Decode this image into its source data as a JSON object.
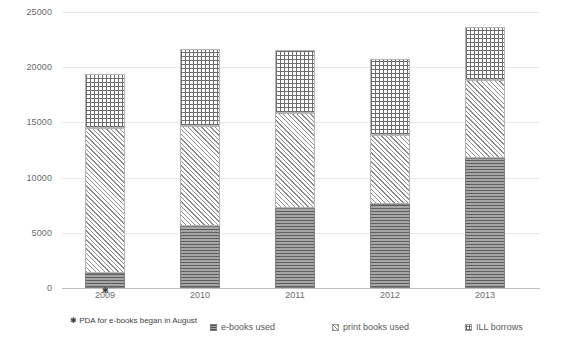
{
  "chart_data": {
    "type": "bar",
    "stacked": true,
    "title": "",
    "xlabel": "",
    "ylabel": "",
    "ylim": [
      0,
      25000
    ],
    "ytick_step": 5000,
    "ytick_labels": [
      "0",
      "5000",
      "10000",
      "15000",
      "20000",
      "25000"
    ],
    "ytick_values": [
      0,
      5000,
      10000,
      15000,
      20000,
      25000
    ],
    "grid": true,
    "legend_position": "bottom",
    "categories": [
      "2009",
      "2010",
      "2011",
      "2012",
      "2013"
    ],
    "series": [
      {
        "name": "e-books used",
        "values": [
          1350,
          5600,
          7300,
          7600,
          11800
        ]
      },
      {
        "name": "print books used",
        "values": [
          13200,
          9100,
          8600,
          6300,
          7100
        ]
      },
      {
        "name": "ILL borrows",
        "values": [
          4900,
          7000,
          5700,
          6900,
          4800
        ]
      }
    ],
    "totals": [
      19450,
      21700,
      21600,
      20800,
      23700
    ],
    "annotations": [
      {
        "text": "✱ PDA for e-books began in August",
        "attached_to": "2009"
      }
    ],
    "marker_symbol": "✱"
  },
  "axis": {
    "y_ticks": [
      "25000",
      "20000",
      "15000",
      "10000",
      "5000",
      "0"
    ],
    "x_ticks": [
      "2009",
      "2010",
      "2011",
      "2012",
      "2013"
    ]
  },
  "footnote": {
    "text": "✱ PDA for e-books began in August"
  },
  "legend": {
    "items": [
      {
        "label": "e-books used",
        "key": "ebooks"
      },
      {
        "label": "print books used",
        "key": "print"
      },
      {
        "label": "ILL borrows",
        "key": "ill"
      }
    ]
  },
  "colors": {
    "gridline": "#e8e8e8",
    "axis": "#bfbfbf",
    "text": "#595959",
    "ebooks_fill": "#a6a6a6",
    "print_fill": "#ffffff",
    "ill_fill": "#ffffff"
  }
}
